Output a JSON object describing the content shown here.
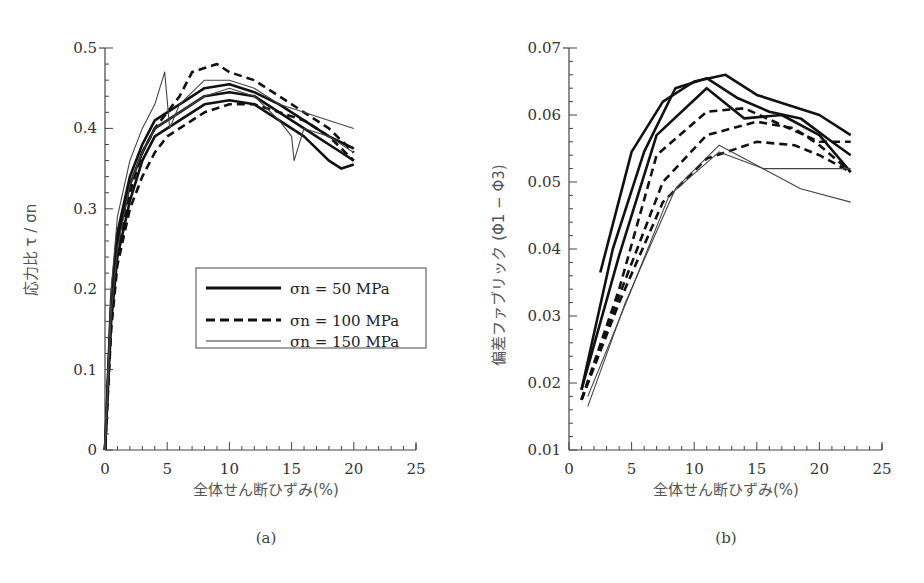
{
  "figure": {
    "panels": [
      "(a)",
      "(b)"
    ],
    "legend": [
      {
        "label": "σn = 50 MPa",
        "style": "solid-thick"
      },
      {
        "label": "σn = 100 MPa",
        "style": "dashed-thick"
      },
      {
        "label": "σn = 150 MPa",
        "style": "solid-thin"
      }
    ]
  },
  "chart_data": [
    {
      "type": "line",
      "panel": "(a)",
      "title": "",
      "xlabel": "全体せん断ひずみ(%)",
      "ylabel": "応力比 τ / σn",
      "xlim": [
        0,
        25
      ],
      "ylim": [
        0,
        0.5
      ],
      "xticks": [
        "0",
        "5",
        "10",
        "15",
        "20",
        "25"
      ],
      "yticks": [
        "0",
        "0.1",
        "0.2",
        "0.3",
        "0.4",
        "0.5"
      ],
      "grid": false,
      "legend_position": "center-right",
      "legend": [
        "σn = 50 MPa",
        "σn = 100 MPa",
        "σn = 150 MPa"
      ],
      "series": [
        {
          "name": "σn = 50 MPa (1)",
          "style": "solid-thick",
          "x": [
            0,
            0.5,
            1,
            2,
            3,
            4,
            5,
            6,
            8,
            10,
            12,
            14,
            16,
            18,
            19,
            20
          ],
          "y": [
            0,
            0.18,
            0.26,
            0.33,
            0.37,
            0.4,
            0.41,
            0.42,
            0.44,
            0.445,
            0.44,
            0.42,
            0.4,
            0.38,
            0.37,
            0.36
          ]
        },
        {
          "name": "σn = 50 MPa (2)",
          "style": "solid-thick",
          "x": [
            0,
            0.5,
            1,
            2,
            3,
            4,
            5,
            6,
            8,
            10,
            12,
            14,
            16,
            18,
            19,
            20
          ],
          "y": [
            0,
            0.16,
            0.24,
            0.31,
            0.36,
            0.39,
            0.4,
            0.41,
            0.43,
            0.435,
            0.43,
            0.41,
            0.39,
            0.36,
            0.35,
            0.355
          ]
        },
        {
          "name": "σn = 50 MPa (3)",
          "style": "solid-thick",
          "x": [
            0,
            0.5,
            1,
            2,
            3,
            4,
            5,
            6,
            8,
            10,
            12,
            14,
            16,
            18,
            20
          ],
          "y": [
            0,
            0.19,
            0.27,
            0.34,
            0.38,
            0.41,
            0.42,
            0.43,
            0.45,
            0.455,
            0.445,
            0.43,
            0.41,
            0.39,
            0.375
          ]
        },
        {
          "name": "σn = 100 MPa (1)",
          "style": "dashed-thick",
          "x": [
            0,
            0.5,
            1,
            2,
            3,
            4,
            5,
            6,
            8,
            10,
            12,
            14,
            16,
            18,
            20
          ],
          "y": [
            0,
            0.15,
            0.23,
            0.3,
            0.34,
            0.37,
            0.39,
            0.4,
            0.42,
            0.43,
            0.43,
            0.42,
            0.41,
            0.39,
            0.36
          ]
        },
        {
          "name": "σn = 100 MPa (2)",
          "style": "dashed-thick",
          "x": [
            0,
            0.5,
            1,
            2,
            3,
            4,
            5,
            6,
            7,
            8,
            9,
            10,
            12,
            14,
            16,
            18,
            20
          ],
          "y": [
            0,
            0.17,
            0.25,
            0.32,
            0.37,
            0.4,
            0.42,
            0.44,
            0.47,
            0.475,
            0.48,
            0.47,
            0.46,
            0.44,
            0.42,
            0.4,
            0.37
          ]
        },
        {
          "name": "σn = 150 MPa (1)",
          "style": "solid-thin",
          "x": [
            0,
            0.5,
            1,
            2,
            3,
            4,
            4.8,
            5.2,
            6,
            8,
            10,
            12,
            14,
            16,
            18,
            20
          ],
          "y": [
            0,
            0.2,
            0.29,
            0.36,
            0.4,
            0.43,
            0.47,
            0.4,
            0.43,
            0.46,
            0.46,
            0.45,
            0.43,
            0.42,
            0.41,
            0.4
          ]
        },
        {
          "name": "σn = 150 MPa (2)",
          "style": "solid-thin",
          "x": [
            0,
            0.5,
            1,
            2,
            3,
            4,
            5,
            6,
            8,
            10,
            12,
            14,
            15,
            15.2,
            16,
            18,
            20
          ],
          "y": [
            0,
            0.17,
            0.25,
            0.33,
            0.37,
            0.4,
            0.41,
            0.42,
            0.44,
            0.45,
            0.44,
            0.41,
            0.39,
            0.36,
            0.4,
            0.39,
            0.37
          ]
        }
      ]
    },
    {
      "type": "line",
      "panel": "(b)",
      "title": "",
      "xlabel": "全体せん断ひずみ(%)",
      "ylabel": "偏差ファブリック (Φ1 − Φ3)",
      "xlim": [
        0,
        25
      ],
      "ylim": [
        0.01,
        0.07
      ],
      "xticks": [
        "0",
        "5",
        "10",
        "15",
        "20",
        "25"
      ],
      "yticks": [
        "0.01",
        "0.02",
        "0.03",
        "0.04",
        "0.05",
        "0.06",
        "0.07"
      ],
      "grid": false,
      "series": [
        {
          "name": "σn = 50 MPa (1)",
          "style": "solid-thick",
          "x": [
            2.5,
            5,
            7.5,
            10,
            12.5,
            15,
            17.5,
            20,
            22.5
          ],
          "y": [
            0.0365,
            0.0545,
            0.062,
            0.065,
            0.066,
            0.063,
            0.0615,
            0.06,
            0.057
          ]
        },
        {
          "name": "σn = 50 MPa (2)",
          "style": "solid-thick",
          "x": [
            1,
            3.5,
            6,
            8.5,
            11,
            13.5,
            16,
            18.5,
            21,
            22.5
          ],
          "y": [
            0.019,
            0.04,
            0.0545,
            0.064,
            0.0655,
            0.0625,
            0.0605,
            0.0595,
            0.056,
            0.054
          ]
        },
        {
          "name": "σn = 50 MPa (3)",
          "style": "solid-thick",
          "x": [
            1,
            4,
            7,
            11,
            14,
            17,
            20,
            22.5
          ],
          "y": [
            0.019,
            0.039,
            0.057,
            0.064,
            0.0595,
            0.06,
            0.057,
            0.0515
          ]
        },
        {
          "name": "σn = 100 MPa (1)",
          "style": "dashed-thick",
          "x": [
            1,
            4,
            7,
            11,
            14,
            17,
            20,
            22.5
          ],
          "y": [
            0.0175,
            0.034,
            0.054,
            0.0605,
            0.061,
            0.0585,
            0.056,
            0.056
          ]
        },
        {
          "name": "σn = 100 MPa (2)",
          "style": "dashed-thick",
          "x": [
            1,
            4,
            7.5,
            11,
            15,
            18,
            20,
            22.5
          ],
          "y": [
            0.0175,
            0.032,
            0.047,
            0.0535,
            0.056,
            0.0555,
            0.054,
            0.0515
          ]
        },
        {
          "name": "σn = 100 MPa (3)",
          "style": "dashed-thick",
          "x": [
            1,
            4,
            7.5,
            11,
            15,
            18,
            20,
            22.5
          ],
          "y": [
            0.0175,
            0.033,
            0.05,
            0.057,
            0.059,
            0.058,
            0.0555,
            0.0515
          ]
        },
        {
          "name": "σn = 150 MPa (1)",
          "style": "solid-thin",
          "x": [
            1.5,
            4.5,
            8.5,
            12,
            15,
            18.5,
            22.5
          ],
          "y": [
            0.0165,
            0.032,
            0.049,
            0.0555,
            0.0525,
            0.049,
            0.047
          ]
        },
        {
          "name": "σn = 150 MPa (2)",
          "style": "solid-thin",
          "x": [
            1.5,
            5,
            8,
            12,
            15.5,
            22.5
          ],
          "y": [
            0.018,
            0.034,
            0.048,
            0.0545,
            0.052,
            0.052
          ]
        }
      ]
    }
  ]
}
